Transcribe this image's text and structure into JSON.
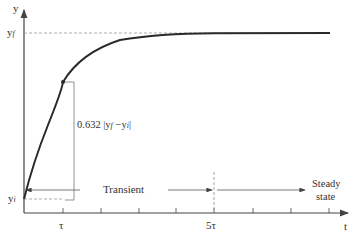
{
  "diagram": {
    "type": "first-order step response",
    "axes": {
      "y_label": "y",
      "x_label": "t"
    },
    "levels": {
      "final": {
        "main": "y",
        "sub": "f"
      },
      "initial": {
        "main": "y",
        "sub": "i"
      }
    },
    "x_ticks": [
      {
        "label": "τ",
        "x": 63
      },
      {
        "label": "",
        "x": 101
      },
      {
        "label": "",
        "x": 139
      },
      {
        "label": "",
        "x": 176
      },
      {
        "label": "5τ",
        "x": 214
      },
      {
        "label": "",
        "x": 253
      },
      {
        "label": "",
        "x": 291
      },
      {
        "label": "",
        "x": 329
      }
    ],
    "annotation": {
      "prefix": "0.632 |y",
      "sub1": "f",
      "mid": " −y",
      "sub2": "i",
      "suffix": "|"
    },
    "regions": {
      "transient": "Transient",
      "steady_line1": "Steady",
      "steady_line2": "state"
    },
    "tau_label": "τ",
    "five_tau_label": "5τ"
  },
  "colors": {
    "axis": "#444444",
    "curve": "#333333",
    "dashed": "#888888",
    "text": "#333333"
  }
}
